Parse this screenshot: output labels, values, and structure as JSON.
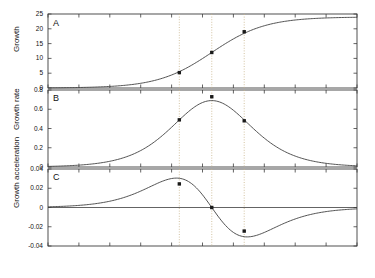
{
  "figure": {
    "xlabel": "Time",
    "panels": [
      {
        "tag": "A",
        "ylabel": "Growth"
      },
      {
        "tag": "B",
        "ylabel": "Growth rate"
      },
      {
        "tag": "C",
        "ylabel": "Growth acceleration"
      }
    ],
    "point_labels": {
      "p1": "P",
      "p1sub": "1",
      "p2": "P",
      "p2sub": "2",
      "p3": "P",
      "p3sub": "3"
    },
    "colors": {
      "axis": "#3c3c3c",
      "curve": "#4a4a4a",
      "guide": "#c8b48a",
      "marker": "#1a1a1a",
      "background": "#ffffff"
    }
  },
  "chart_data": [
    {
      "type": "line",
      "title": "",
      "panel": "A",
      "xlabel": "Time",
      "ylabel": "Growth",
      "xlim": [
        0,
        100
      ],
      "ylim": [
        0,
        25
      ],
      "xticks": [
        0,
        10,
        20,
        30,
        40,
        50,
        60,
        70,
        80,
        90,
        100
      ],
      "xticklabels": [
        "0",
        "10",
        "20",
        "30",
        "40",
        "50",
        "60",
        "70",
        "80",
        "90",
        "100"
      ],
      "yticks": [
        0,
        5,
        10,
        15,
        20,
        25
      ],
      "yticklabels": [
        "0",
        "5",
        "10",
        "15",
        "20",
        "25"
      ],
      "grid": false,
      "legend": "none",
      "curve_model": "logistic",
      "curve_params": {
        "L": 24,
        "k": 0.115,
        "x0": 53
      },
      "annotations": [
        {
          "label": "P1",
          "x": 42.5,
          "y": 5.2
        },
        {
          "label": "P2",
          "x": 53.0,
          "y": 12.0
        },
        {
          "label": "P3",
          "x": 63.5,
          "y": 19.0
        }
      ]
    },
    {
      "type": "line",
      "title": "",
      "panel": "B",
      "xlabel": "Time",
      "ylabel": "Growth rate",
      "xlim": [
        0,
        100
      ],
      "ylim": [
        0,
        0.8
      ],
      "xticks": [
        0,
        10,
        20,
        30,
        40,
        50,
        60,
        70,
        80,
        90,
        100
      ],
      "yticks": [
        0,
        0.2,
        0.4,
        0.6,
        0.8
      ],
      "yticklabels": [
        "0",
        "0.2",
        "0.4",
        "0.6",
        "0.8"
      ],
      "grid": false,
      "legend": "none",
      "curve_model": "logistic-first-derivative",
      "annotations": [
        {
          "label": "P1",
          "x": 42.5,
          "y": 0.49
        },
        {
          "label": "P2",
          "x": 53.0,
          "y": 0.73
        },
        {
          "label": "P3",
          "x": 63.5,
          "y": 0.48
        }
      ]
    },
    {
      "type": "line",
      "title": "",
      "panel": "C",
      "xlabel": "Time",
      "ylabel": "Growth acceleration",
      "xlim": [
        0,
        100
      ],
      "ylim": [
        -0.04,
        0.04
      ],
      "xticks": [
        0,
        10,
        20,
        30,
        40,
        50,
        60,
        70,
        80,
        90,
        100
      ],
      "yticks": [
        -0.04,
        -0.02,
        0,
        0.02,
        0.04
      ],
      "yticklabels": [
        "-0.04",
        "-0.02",
        "0",
        "0.02",
        "0.04"
      ],
      "grid": false,
      "legend": "none",
      "curve_model": "logistic-second-derivative",
      "annotations": [
        {
          "label": "P1",
          "x": 42.5,
          "y": 0.0245
        },
        {
          "label": "P2",
          "x": 53.0,
          "y": 0.0
        },
        {
          "label": "P3",
          "x": 63.5,
          "y": -0.0245
        }
      ]
    }
  ]
}
